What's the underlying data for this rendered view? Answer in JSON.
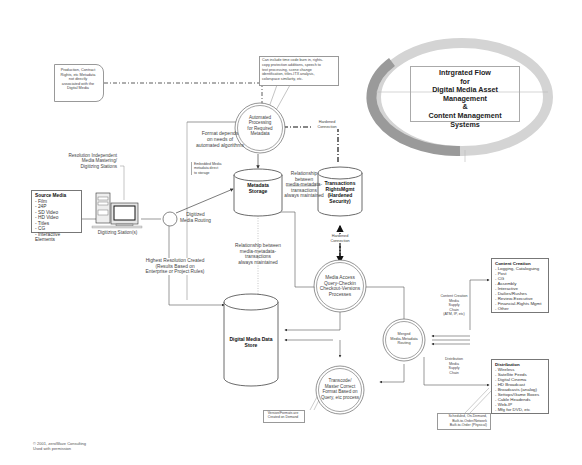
{
  "title": {
    "lines": [
      "Intrgrated Flow",
      "for",
      "Digital Media Asset Management",
      "&",
      "Content Management",
      "Systems"
    ]
  },
  "notes": {
    "production_rights": "Production, Contract\nRights, etc Metadata\nnot directly\nassociated with the\nDigital Media",
    "automated_callout": "Can include time code burn in, rights-\ncopy protection additions, speech to\ntext processing, scene change\nidentification, titles-ITX analysis,\ncolorspace similarity, etc.",
    "format_depends": "Format depends\non needs of\nautomated algorithms",
    "hardened_connection_top": "Hardened\nConnection",
    "hardened_connection_mid": "Hardened\nConnection",
    "resolution_independent": "Resolution Independent\nMedia Mastering/\nDigitizing Stations",
    "embedded_metadata": "Embedded Media\nmetadata direct\nto storage",
    "relationship_1": "Relationship between\nmedia-metadata-\ntransactions\nalways maintained",
    "relationship_2": "Relationship between\nmedia-metadata-\ntransactions\nalways maintained",
    "digitized_routing": "Digitized\nMedia Routing",
    "digitizing_stations": "Digitizing Station(s)",
    "highest_resolution": "Highest Resolution Created\n(Results Based on\nEnterprise or Project Rules)",
    "content_supply_chain": "Content Creation\nMedia\nSupply\nChain\n(ATM, IP, etc)",
    "distribution_supply_chain": "Distribution\nMedia\nSupply\nChain",
    "scheduled": "Scheduled, On-Demand,\nBuilt-to-Order/Network\nBuilt-to-Order (Physical)",
    "versions_formats": "Version/Formats are\nCreated on Demand",
    "copyright": "© 2001, zeroWave Consulting\nUsed with permission"
  },
  "nodes": {
    "automated_processing": "Automated\nProcessing\nfor Required\nMetadata",
    "metadata_storage": "Metadata\nStorage",
    "transactions": "Transactions\nRightsMgmt\n(Hardened\nSecurity)",
    "media_access": "Media Access\nQuery-Checkin\nCheckout-Versions\nProcesses",
    "digital_media_store": "Digital Media Data\nStore",
    "merged_routing": "Merged\nMedia-Metadata\nRouting",
    "transcoder": "Transcode/\nMaster Correct\nFormat Based on\nQuery, etc process"
  },
  "source_media": {
    "heading": "Source Media",
    "items": [
      "- Film",
      "- 24P",
      "- SD Video",
      "- HD Video",
      "- Titles",
      "- CG",
      "- Interactive Elements"
    ]
  },
  "content_creation": {
    "heading": "Content Creation",
    "items": [
      "- Logging, Cataloguing",
      "- Post",
      "- CG",
      "- Assembly",
      "- Interactive",
      "- Dailies/Rushes",
      "- Review-Executive",
      "- Financial-Rights Mgmt",
      "- Other"
    ]
  },
  "distribution": {
    "heading": "Distribution",
    "items": [
      "- Wireless",
      "- Satellite Feeds",
      "- Digital Cinema",
      "- HD Broadcast",
      "- Broadcasts (analog)",
      "- Settops/Game Boxes",
      "- Cable Headends",
      "- Web-IP",
      "- Mfg for DVD, etc"
    ]
  },
  "colors": {
    "ring_dark": "#8f8f8f",
    "ring_light": "#cfcfcf",
    "line": "#555555"
  }
}
